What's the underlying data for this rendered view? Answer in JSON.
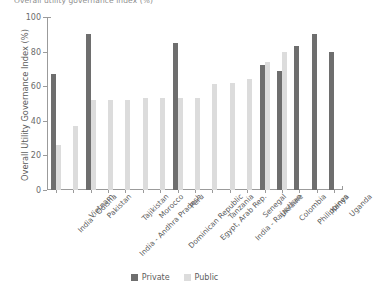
{
  "figure": {
    "title_cropped": "Overall utility governance index (%)"
  },
  "chart_data": {
    "type": "bar",
    "title": "Overall utility governance index (%)",
    "xlabel": "",
    "ylabel": "Overall Utility Governance Index (%)",
    "ylim": [
      0,
      100
    ],
    "yticks": [
      0,
      20,
      40,
      60,
      80,
      100
    ],
    "grid": false,
    "legend_position": "bottom-center",
    "categories": [
      "India - Odisha",
      "Vietnam",
      "Pakistan",
      "India - Andhra Pradesh",
      "Tajikistan",
      "Morocco",
      "Dominican Republic",
      "Peru",
      "Egypt, Arab Rep.",
      "Tanzania",
      "India - Rajasthan",
      "Senegal",
      "Ukraine",
      "Colombia",
      "Philippines",
      "Kenya",
      "Uganda"
    ],
    "series": [
      {
        "name": "Private",
        "color": "#6e6e6e",
        "values": [
          67,
          null,
          90,
          null,
          null,
          null,
          null,
          85,
          null,
          null,
          null,
          null,
          72,
          69,
          83,
          90,
          80
        ]
      },
      {
        "name": "Public",
        "color": "#dcdcdc",
        "values": [
          26,
          37,
          52,
          52,
          52,
          53,
          53,
          53,
          53,
          61,
          62,
          64,
          74,
          80,
          null,
          null,
          null
        ]
      }
    ]
  },
  "legend": {
    "items": [
      {
        "label": "Private",
        "color": "#6e6e6e"
      },
      {
        "label": "Public",
        "color": "#dcdcdc"
      }
    ]
  }
}
